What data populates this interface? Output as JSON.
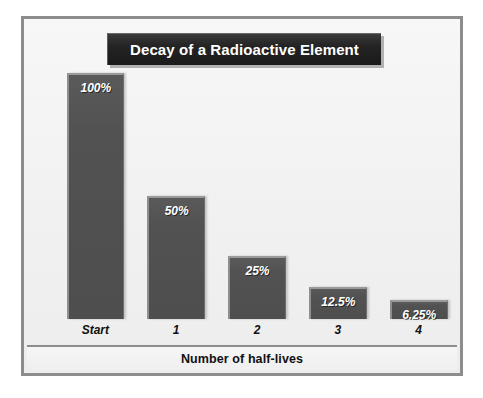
{
  "figure": {
    "title": "Decay of a Radioactive Element",
    "axis_title": "Number of half-lives",
    "frame_color": "#8d8d8d",
    "plot_background": "#f2f2f2",
    "bar_color": "#4e4e4e",
    "bar_highlight_color": "#9a9a9a",
    "title_plaque_color": "#1f1f1f",
    "label_color": "#ffffff"
  },
  "chart_data": {
    "type": "bar",
    "title": "Decay of a Radioactive Element",
    "xlabel": "Number of half-lives",
    "ylabel": "",
    "categories": [
      "Start",
      "1",
      "2",
      "3",
      "4"
    ],
    "values": [
      100,
      50,
      25,
      12.5,
      6.25
    ],
    "data_labels": [
      "100%",
      "50%",
      "25%",
      "12.5%",
      "6.25%"
    ],
    "ylim": [
      0,
      100
    ],
    "grid": false,
    "legend": false,
    "axis_ticks_visible": false,
    "series": [
      {
        "name": "Remaining radioactive element",
        "values": [
          100,
          50,
          25,
          12.5,
          6.25
        ],
        "unit": "%"
      }
    ]
  },
  "bars": [
    {
      "label": "100%",
      "category": "Start",
      "value": 100,
      "left_pct": 9.2,
      "width_pct": 13.4,
      "height_pct": 97.5
    },
    {
      "label": "50%",
      "category": "1",
      "value": 50,
      "left_pct": 28.0,
      "width_pct": 13.4,
      "height_pct": 49.0
    },
    {
      "label": "25%",
      "category": "2",
      "value": 25,
      "left_pct": 46.8,
      "width_pct": 13.4,
      "height_pct": 25.0
    },
    {
      "label": "12.5%",
      "category": "3",
      "value": 12.5,
      "left_pct": 65.6,
      "width_pct": 13.4,
      "height_pct": 12.7
    },
    {
      "label": "6.25%",
      "category": "4",
      "value": 6.25,
      "left_pct": 84.4,
      "width_pct": 13.4,
      "height_pct": 7.5
    }
  ]
}
